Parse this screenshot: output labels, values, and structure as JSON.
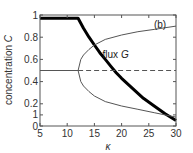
{
  "chart_data": {
    "type": "line",
    "panel_label": "(b)",
    "xlabel": "κ",
    "ylabel": "concentration C",
    "xlim": [
      5,
      30
    ],
    "ylim": [
      0,
      1
    ],
    "x_ticks": [
      5,
      10,
      15,
      20,
      25,
      30
    ],
    "y_ticks": [
      {
        "value": 0,
        "label": "0"
      },
      {
        "value": 0.1,
        "label": "1"
      },
      {
        "value": 0.2,
        "label": "0.2"
      },
      {
        "value": 0.4,
        "label": "0.4"
      },
      {
        "value": 0.6,
        "label": "0.6"
      },
      {
        "value": 0.8,
        "label": "0.8"
      },
      {
        "value": 1,
        "label": "1"
      }
    ],
    "grid": false,
    "annotations": [
      {
        "text": "flux G",
        "x": 16.5,
        "y": 0.61
      }
    ],
    "series": [
      {
        "name": "flux G",
        "style": "thick-solid",
        "color": "#000000",
        "x": [
          5,
          8,
          12,
          13,
          14,
          15,
          16,
          17,
          18,
          19,
          20,
          22,
          24,
          26,
          28,
          30
        ],
        "y": [
          0.97,
          0.97,
          0.97,
          0.88,
          0.8,
          0.73,
          0.66,
          0.6,
          0.54,
          0.48,
          0.43,
          0.34,
          0.25,
          0.18,
          0.11,
          0.05
        ]
      },
      {
        "name": "C symmetric (stable)",
        "style": "thin-solid",
        "color": "#555555",
        "x": [
          5,
          12
        ],
        "y": [
          0.5,
          0.5
        ]
      },
      {
        "name": "C symmetric (unstable)",
        "style": "thin-dashed",
        "color": "#555555",
        "x": [
          12,
          30
        ],
        "y": [
          0.5,
          0.5
        ]
      },
      {
        "name": "C upper branch",
        "style": "thin-solid",
        "color": "#555555",
        "x": [
          12,
          12.5,
          13,
          14,
          15,
          17,
          20,
          23,
          26,
          30
        ],
        "y": [
          0.5,
          0.6,
          0.64,
          0.69,
          0.73,
          0.78,
          0.82,
          0.85,
          0.87,
          0.9
        ]
      },
      {
        "name": "C lower branch",
        "style": "thin-solid",
        "color": "#555555",
        "x": [
          12,
          12.5,
          13,
          14,
          15,
          17,
          20,
          23,
          26,
          30
        ],
        "y": [
          0.5,
          0.4,
          0.36,
          0.31,
          0.27,
          0.22,
          0.18,
          0.15,
          0.12,
          0.08
        ]
      }
    ]
  }
}
